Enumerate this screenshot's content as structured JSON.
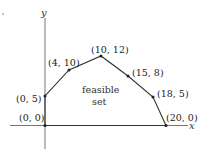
{
  "figure": {
    "x_axis_label": "x",
    "y_axis_label": "y",
    "region_label_line1": "feasible",
    "region_label_line2": "set",
    "vertices": [
      {
        "label": "(0, 0)",
        "x": 0,
        "y": 0
      },
      {
        "label": "(0, 5)",
        "x": 0,
        "y": 5
      },
      {
        "label": "(4, 10)",
        "x": 4,
        "y": 10
      },
      {
        "label": "(10, 12)",
        "x": 10,
        "y": 12
      },
      {
        "label": "(15, 8)",
        "x": 15,
        "y": 8
      },
      {
        "label": "(18, 5)",
        "x": 18,
        "y": 5
      },
      {
        "label": "(20, 0)",
        "x": 20,
        "y": 0
      }
    ],
    "colors": {
      "line": "#333333",
      "axis": "#555555",
      "point": "#222222"
    }
  }
}
